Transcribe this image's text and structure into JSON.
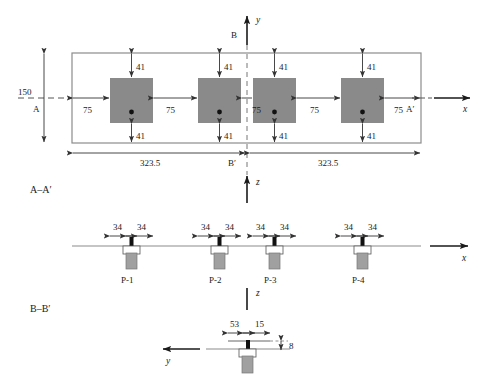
{
  "figure": {
    "colors": {
      "line": "#333333",
      "fill_gray": "#8a8a8a",
      "pile_black": "#000000",
      "pile_gray": "#a0a0a0",
      "background": "#ffffff"
    }
  },
  "plan_view": {
    "axis_y_label": "y",
    "axis_x_label": "x",
    "section_line_top_label": "B",
    "section_line_bottom_label": "B′",
    "section_left_label": "A",
    "section_right_label": "A′",
    "width_dim": "150",
    "half_length_left": "323.5",
    "half_length_right": "323.5",
    "spacing_labels": [
      "75",
      "75",
      "75",
      "75",
      "75"
    ],
    "offset_top_labels": [
      "41",
      "41",
      "41",
      "41"
    ],
    "offset_bottom_labels": [
      "41",
      "41",
      "41",
      "41"
    ],
    "pile_count": 4
  },
  "section_aa": {
    "view_label": "A–A′",
    "axis_z_label": "z",
    "axis_x_label": "x",
    "piles": [
      {
        "name": "P-1",
        "left_dim": "34",
        "right_dim": "34"
      },
      {
        "name": "P-2",
        "left_dim": "34",
        "right_dim": "34"
      },
      {
        "name": "P-3",
        "left_dim": "34",
        "right_dim": "34"
      },
      {
        "name": "P-4",
        "left_dim": "34",
        "right_dim": "34"
      }
    ]
  },
  "section_bb": {
    "view_label": "B–B′",
    "axis_z_label": "z",
    "axis_y_label": "y",
    "left_dim": "53",
    "right_dim": "15",
    "height_dim": "8"
  }
}
